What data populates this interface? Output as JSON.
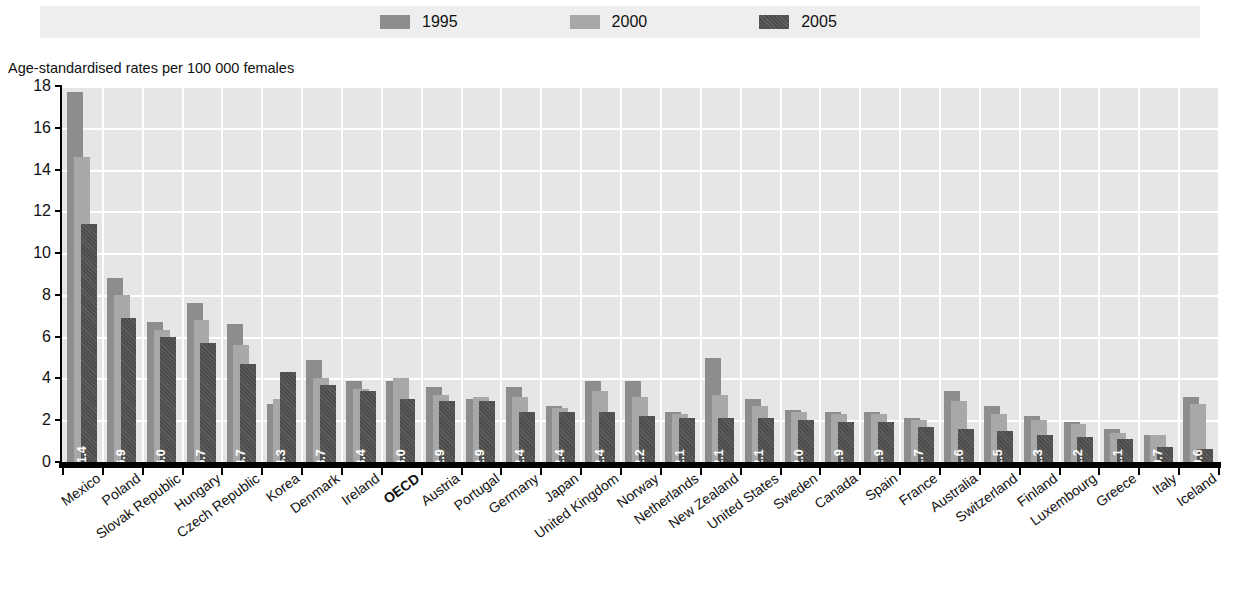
{
  "legend": {
    "entries": [
      {
        "label": "1995",
        "color": "#8d8d8d",
        "name": "legend-1995"
      },
      {
        "label": "2000",
        "color": "#a8a8a8",
        "name": "legend-2000"
      },
      {
        "label": "2005",
        "color": "#4d4d4d",
        "name": "legend-2005"
      }
    ]
  },
  "axis_caption": "Age-standardised rates per 100 000 females",
  "chart_data": {
    "type": "bar",
    "title": "",
    "xlabel": "",
    "ylabel": "Age-standardised rates per 100 000 females",
    "ylim": [
      0,
      18
    ],
    "yticks": [
      0,
      2,
      4,
      6,
      8,
      10,
      12,
      14,
      16,
      18
    ],
    "grid": true,
    "legend_position": "top",
    "highlight_category": "OECD",
    "categories": [
      "Mexico",
      "Poland",
      "Slovak Republic",
      "Hungary",
      "Czech Republic",
      "Korea",
      "Denmark",
      "Ireland",
      "OECD",
      "Austria",
      "Portugal",
      "Germany",
      "Japan",
      "United Kingdom",
      "Norway",
      "Netherlands",
      "New Zealand",
      "United States",
      "Sweden",
      "Canada",
      "Spain",
      "France",
      "Australia",
      "Switzerland",
      "Finland",
      "Luxembourg",
      "Greece",
      "Italy",
      "Iceland"
    ],
    "series": [
      {
        "name": "1995",
        "color": "#8d8d8d",
        "values": [
          17.7,
          8.8,
          6.7,
          7.6,
          6.6,
          2.8,
          4.9,
          3.9,
          3.9,
          3.6,
          3.0,
          3.6,
          2.7,
          3.9,
          3.9,
          2.4,
          5.0,
          3.0,
          2.5,
          2.4,
          2.4,
          2.1,
          3.4,
          2.7,
          2.2,
          1.9,
          1.6,
          1.3,
          3.1
        ]
      },
      {
        "name": "2000",
        "color": "#a8a8a8",
        "values": [
          14.6,
          8.0,
          6.3,
          6.8,
          5.6,
          3.0,
          4.0,
          3.5,
          4.0,
          3.2,
          3.1,
          3.1,
          2.6,
          3.4,
          3.1,
          2.3,
          3.2,
          2.7,
          2.4,
          2.3,
          2.3,
          2.0,
          2.9,
          2.3,
          2.0,
          1.8,
          1.4,
          1.3,
          2.8
        ]
      },
      {
        "name": "2005",
        "color": "#4d4d4d",
        "values": [
          11.4,
          6.9,
          6.0,
          5.7,
          4.7,
          4.3,
          3.7,
          3.4,
          3.0,
          2.9,
          2.9,
          2.4,
          2.4,
          2.4,
          2.2,
          2.1,
          2.1,
          2.1,
          2.0,
          1.9,
          1.9,
          1.7,
          1.6,
          1.5,
          1.3,
          1.2,
          1.1,
          0.7,
          0.6
        ],
        "labels": [
          "11.4",
          "6.9",
          "6.0",
          "5.7",
          "4.7",
          "4.3",
          "3.7",
          "3.4",
          "3.0",
          "2.9",
          "2.9",
          "2.4",
          "2.4",
          "2.4",
          "2.2",
          "2.1",
          "2.1",
          "2.1",
          "2.0",
          "1.9",
          "1.9",
          "1.7",
          "1.6",
          "1.5",
          "1.3",
          "1.2",
          "1.1",
          "0.7",
          "0.6"
        ]
      }
    ]
  }
}
